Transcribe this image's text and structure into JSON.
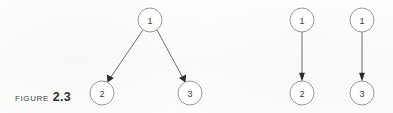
{
  "figure": {
    "caption_word": "Figure",
    "caption_number": "2.3",
    "background_color": "#fdfdfc",
    "node_stroke_color": "#8d8d8a",
    "node_fill_color": "#ffffff",
    "edge_color": "#5e5e5c",
    "arrowhead_color": "#2b2b2a",
    "label_color": "#3b3b3a"
  },
  "diagrams": [
    {
      "name": "fork-graph",
      "nodes": [
        {
          "id": "left-node-1",
          "label": "1",
          "cx": 150,
          "cy": 20,
          "r": 12
        },
        {
          "id": "left-node-2",
          "label": "2",
          "cx": 102,
          "cy": 93,
          "r": 12
        },
        {
          "id": "left-node-3",
          "label": "3",
          "cx": 190,
          "cy": 93,
          "r": 12
        }
      ],
      "edges": [
        {
          "id": "edge-1-to-2",
          "from": "1",
          "to": "2",
          "x1": 143,
          "y1": 30,
          "x2": 108,
          "y2": 82
        },
        {
          "id": "edge-1-to-3",
          "from": "1",
          "to": "3",
          "x1": 157,
          "y1": 30,
          "x2": 185,
          "y2": 82
        }
      ]
    },
    {
      "name": "single-edge-graph-a",
      "nodes": [
        {
          "id": "right-a-node-1",
          "label": "1",
          "cx": 302,
          "cy": 20,
          "r": 12
        },
        {
          "id": "right-a-node-2",
          "label": "2",
          "cx": 302,
          "cy": 93,
          "r": 12
        }
      ],
      "edges": [
        {
          "id": "edge-a-1-to-2",
          "from": "1",
          "to": "2",
          "x1": 302,
          "y1": 32,
          "x2": 302,
          "y2": 81
        }
      ]
    },
    {
      "name": "single-edge-graph-b",
      "nodes": [
        {
          "id": "right-b-node-1",
          "label": "1",
          "cx": 362,
          "cy": 20,
          "r": 12
        },
        {
          "id": "right-b-node-3",
          "label": "3",
          "cx": 362,
          "cy": 93,
          "r": 12
        }
      ],
      "edges": [
        {
          "id": "edge-b-1-to-3",
          "from": "1",
          "to": "3",
          "x1": 362,
          "y1": 32,
          "x2": 362,
          "y2": 81
        }
      ]
    }
  ]
}
